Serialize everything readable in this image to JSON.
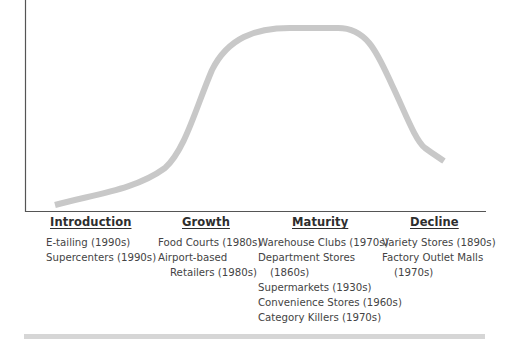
{
  "diagram": {
    "type": "retail-life-cycle",
    "curve_color": "#c8c8c8",
    "axis_color": "#555555",
    "stages": [
      {
        "title": "Introduction",
        "items": [
          "E-tailing (1990s)",
          "Supercenters (1990s)"
        ]
      },
      {
        "title": "Growth",
        "items": [
          "Food Courts (1980s)",
          "Airport-based|Retailers (1980s)"
        ]
      },
      {
        "title": "Maturity",
        "items": [
          "Warehouse Clubs (1970s)",
          "Department Stores|(1860s)",
          "Supermarkets (1930s)",
          "Convenience Stores (1960s)",
          "Category Killers (1970s)"
        ]
      },
      {
        "title": "Decline",
        "items": [
          "Variety Stores (1890s)",
          "Factory Outlet Malls|(1970s)"
        ]
      }
    ]
  }
}
